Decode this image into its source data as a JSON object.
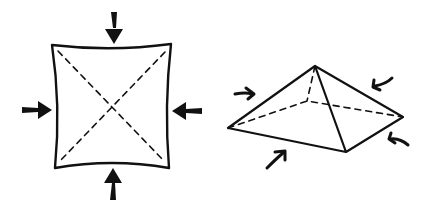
{
  "diagram": {
    "colors": {
      "stroke": "#111111",
      "background": "#ffffff"
    },
    "figures": [
      {
        "name": "flat-square",
        "arrows": 4,
        "arrow_style": "straight-inward"
      },
      {
        "name": "pyramid",
        "arrows": 4,
        "arrow_style": "curved-inward"
      }
    ]
  }
}
